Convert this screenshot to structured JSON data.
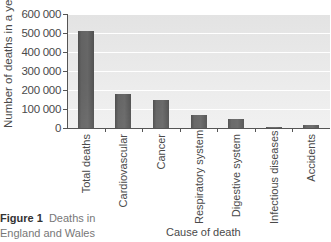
{
  "chart_data": {
    "type": "bar",
    "title": "",
    "xlabel": "Cause of death",
    "ylabel": "Number of deaths in a year",
    "categories": [
      "Total deaths",
      "Cardiovascular",
      "Cancer",
      "Respiratory system",
      "Digestive system",
      "Infectious diseases",
      "Accidents"
    ],
    "values": [
      510000,
      180000,
      145000,
      70000,
      45000,
      5000,
      17000
    ],
    "ylim": [
      0,
      600000
    ],
    "yticks": [
      "600 000",
      "500 000",
      "400 000",
      "300 000",
      "200 000",
      "100 000",
      "0"
    ],
    "grid": true,
    "legend": null
  },
  "caption": {
    "label": "Figure 1",
    "text_line1": "Deaths in",
    "text_line2": "England and Wales"
  },
  "colors": {
    "bar": "#505050",
    "plot_background": "#e8e8e8",
    "gridline": "#ffffff"
  }
}
